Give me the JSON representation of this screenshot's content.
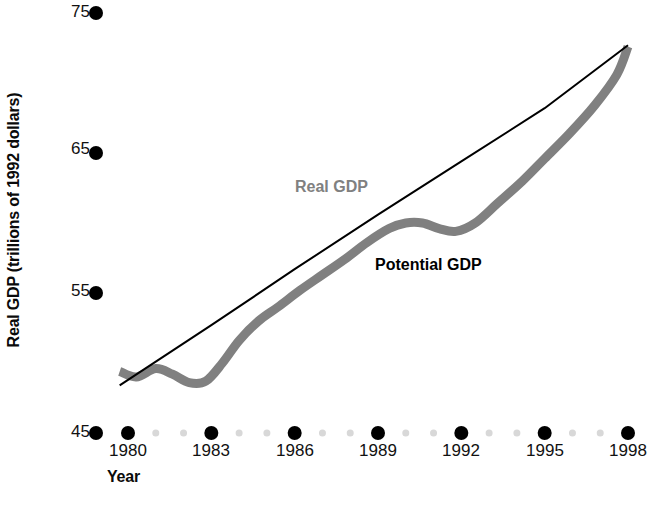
{
  "figure": {
    "background_color": "#ffffff"
  },
  "axes": {
    "y_title": "Real GDP (trillions of 1992 dollars)",
    "x_title": "Year",
    "y_ticks": [
      "75",
      "65",
      "55",
      "45"
    ],
    "x_ticks": [
      "1980",
      "1983",
      "1986",
      "1989",
      "1992",
      "1995",
      "1998"
    ],
    "tick_marker_color": "#000000",
    "minor_tick_marker_color": "#d8d8d8"
  },
  "series_labels": {
    "real_gdp": "Real GDP",
    "potential_gdp": "Potential GDP"
  },
  "colors": {
    "real_gdp": "#808080",
    "potential_gdp": "#000000",
    "text": "#0a0a0a"
  },
  "chart_data": {
    "type": "line",
    "title": "",
    "xlabel": "Year",
    "ylabel": "Real GDP (trillions of 1992 dollars)",
    "xlim": [
      1979.7,
      1998.0
    ],
    "ylim": [
      45,
      75
    ],
    "yticks": [
      45,
      55,
      65,
      75
    ],
    "xticks": [
      1980,
      1983,
      1986,
      1989,
      1992,
      1995,
      1998
    ],
    "grid": false,
    "legend": "inline-annotations",
    "series": [
      {
        "name": "Real GDP",
        "color": "#808080",
        "line_width_px": 9,
        "x": [
          1979.7,
          1980.3,
          1981.0,
          1981.6,
          1982.2,
          1982.8,
          1983.4,
          1984.0,
          1984.7,
          1985.4,
          1986.2,
          1987.0,
          1987.8,
          1988.6,
          1989.4,
          1990.0,
          1990.6,
          1991.2,
          1991.8,
          1992.5,
          1993.3,
          1994.2,
          1995.0,
          1995.9,
          1996.8,
          1997.6,
          1998.0
        ],
        "y": [
          49.4,
          49.0,
          49.6,
          49.2,
          48.6,
          48.7,
          50.0,
          51.6,
          53.0,
          54.0,
          55.2,
          56.3,
          57.4,
          58.6,
          59.6,
          60.0,
          60.0,
          59.6,
          59.4,
          60.0,
          61.4,
          63.0,
          64.6,
          66.4,
          68.4,
          70.6,
          72.6
        ]
      },
      {
        "name": "Potential GDP",
        "color": "#000000",
        "line_width_px": 2,
        "x": [
          1979.7,
          1983.0,
          1986.0,
          1989.0,
          1992.0,
          1995.0,
          1998.0
        ],
        "y": [
          48.4,
          52.7,
          56.7,
          60.6,
          64.4,
          68.2,
          72.7
        ]
      }
    ],
    "annotations": [
      {
        "text": "Real GDP",
        "x": 1986.0,
        "y": 61.8,
        "color": "#808080"
      },
      {
        "text": "Potential GDP",
        "x": 1990.6,
        "y": 57.4,
        "color": "#000000"
      }
    ]
  }
}
